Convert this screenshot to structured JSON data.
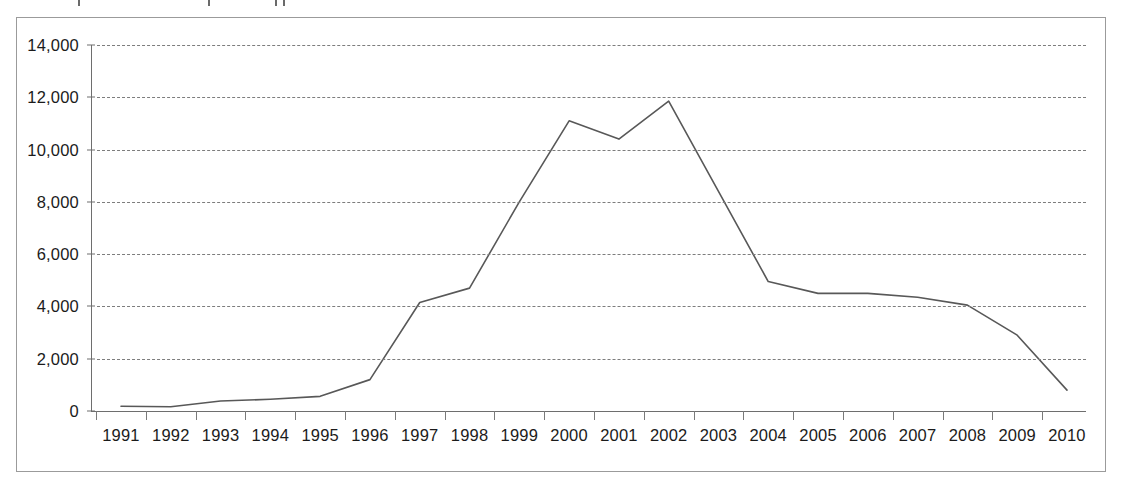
{
  "figure": {
    "frame": {
      "border_color": "#9b9b9b"
    },
    "background": "#ffffff"
  },
  "chart_data": {
    "type": "line",
    "title": "",
    "subtitle": "",
    "xlabel": "",
    "ylabel": "",
    "grid": true,
    "grid_style": "dashed-horizontal",
    "legend": false,
    "legend_position": "none",
    "line_color": "#585858",
    "line_width": 1.6,
    "markers": false,
    "xlim": [
      "1991",
      "2010"
    ],
    "ylim": [
      0,
      14000
    ],
    "ytick_step": 2000,
    "ytick_labels": [
      "0",
      "2,000",
      "4,000",
      "6,000",
      "8,000",
      "10,000",
      "12,000",
      "14,000"
    ],
    "ytick_values": [
      0,
      2000,
      4000,
      6000,
      8000,
      10000,
      12000,
      14000
    ],
    "categories": [
      "1991",
      "1992",
      "1993",
      "1994",
      "1995",
      "1996",
      "1997",
      "1998",
      "1999",
      "2000",
      "2001",
      "2002",
      "2003",
      "2004",
      "2005",
      "2006",
      "2007",
      "2008",
      "2009",
      "2010"
    ],
    "values": [
      180,
      160,
      380,
      450,
      560,
      1200,
      4150,
      4700,
      8000,
      11100,
      10400,
      11850,
      8400,
      4950,
      4500,
      4500,
      4350,
      4050,
      2900,
      800
    ],
    "series": [
      {
        "name": "",
        "values": [
          180,
          160,
          380,
          450,
          560,
          1200,
          4150,
          4700,
          8000,
          11100,
          10400,
          11850,
          8400,
          4950,
          4500,
          4500,
          4350,
          4050,
          2900,
          800
        ]
      }
    ],
    "annotations": []
  }
}
